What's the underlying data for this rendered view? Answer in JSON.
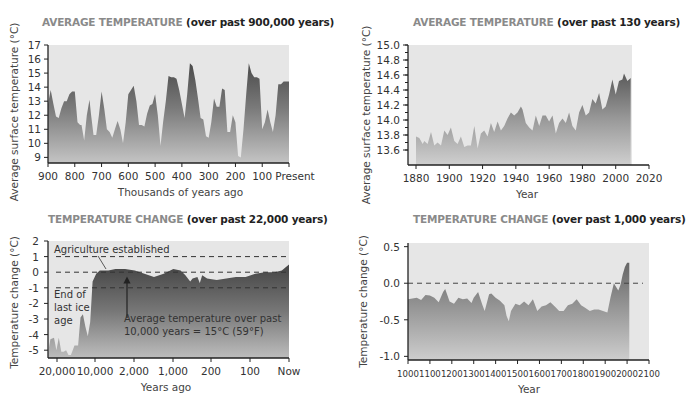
{
  "chart_data": [
    {
      "id": "c1",
      "type": "area",
      "title_main": "AVERAGE TEMPERATURE",
      "title_sub": "(over past 900,000 years)",
      "xlabel": "Thousands of years ago",
      "ylabel": "Average surface temperature (°C)",
      "ylim": [
        9,
        17
      ],
      "yticks": [
        9,
        10,
        11,
        12,
        13,
        14,
        15,
        16,
        17
      ],
      "xticks": [
        "900",
        "800",
        "700",
        "600",
        "500",
        "400",
        "300",
        "200",
        "100",
        "Present"
      ],
      "x": [
        900,
        890,
        880,
        870,
        860,
        850,
        840,
        830,
        820,
        810,
        800,
        790,
        780,
        775,
        765,
        755,
        745,
        740,
        730,
        720,
        710,
        700,
        690,
        680,
        670,
        660,
        650,
        640,
        630,
        620,
        610,
        600,
        590,
        580,
        570,
        560,
        550,
        540,
        530,
        520,
        510,
        500,
        490,
        480,
        470,
        460,
        450,
        440,
        430,
        420,
        410,
        400,
        390,
        380,
        370,
        360,
        350,
        340,
        330,
        320,
        310,
        300,
        290,
        280,
        270,
        260,
        250,
        240,
        230,
        220,
        210,
        200,
        190,
        180,
        170,
        160,
        150,
        140,
        130,
        120,
        110,
        100,
        90,
        80,
        70,
        60,
        50,
        40,
        30,
        20,
        10,
        0
      ],
      "values": [
        12.8,
        13.8,
        12.8,
        11.9,
        11.8,
        12.5,
        13.0,
        13.0,
        13.5,
        13.7,
        13.7,
        11.5,
        11.3,
        11.3,
        10.2,
        12.0,
        13.1,
        12.2,
        10.6,
        10.6,
        12.0,
        13.7,
        12.5,
        11.0,
        10.8,
        10.4,
        11.0,
        11.6,
        11.0,
        10.0,
        11.5,
        13.5,
        13.8,
        14.1,
        13.0,
        11.3,
        11.3,
        11.2,
        12.1,
        12.7,
        12.8,
        13.5,
        12.0,
        9.8,
        11.5,
        13.0,
        14.8,
        14.7,
        14.7,
        14.6,
        13.8,
        12.8,
        11.8,
        13.5,
        15.7,
        15.5,
        14.5,
        13.2,
        11.8,
        11.7,
        10.5,
        10.4,
        11.5,
        13.2,
        12.6,
        12.6,
        13.9,
        13.8,
        10.8,
        10.8,
        12.0,
        11.5,
        9.1,
        9.0,
        11.0,
        13.5,
        15.7,
        15.0,
        14.7,
        14.7,
        14.6,
        11.0,
        11.5,
        12.4,
        11.5,
        10.8,
        12.0,
        14.2,
        14.2,
        14.4,
        14.4,
        14.4
      ]
    },
    {
      "id": "c2",
      "type": "area",
      "title_main": "AVERAGE TEMPERATURE",
      "title_sub": "(over past 130 years)",
      "xlabel": "Year",
      "ylabel": "Average surface temperature (°C)",
      "ylim": [
        13.6,
        15.0
      ],
      "yticks": [
        "15.0",
        "14.8",
        "14.6",
        "14.4",
        "14.2",
        "14.0",
        "13.8",
        "13.6"
      ],
      "xticks": [
        "1880",
        "1900",
        "1920",
        "1940",
        "1960",
        "1980",
        "2000",
        "2020"
      ],
      "x": [
        1880,
        1882,
        1884,
        1885,
        1887,
        1889,
        1891,
        1893,
        1895,
        1897,
        1899,
        1901,
        1903,
        1905,
        1907,
        1909,
        1911,
        1913,
        1915,
        1917,
        1919,
        1921,
        1923,
        1925,
        1927,
        1929,
        1931,
        1933,
        1935,
        1937,
        1939,
        1941,
        1943,
        1944,
        1946,
        1948,
        1950,
        1952,
        1954,
        1956,
        1958,
        1960,
        1962,
        1964,
        1966,
        1968,
        1970,
        1972,
        1974,
        1976,
        1978,
        1980,
        1982,
        1984,
        1986,
        1988,
        1990,
        1992,
        1994,
        1996,
        1998,
        2000,
        2002,
        2004,
        2005,
        2007,
        2009
      ],
      "values": [
        13.78,
        13.76,
        13.68,
        13.72,
        13.68,
        13.84,
        13.66,
        13.7,
        13.66,
        13.86,
        13.8,
        13.9,
        13.72,
        13.68,
        13.78,
        13.64,
        13.66,
        13.66,
        13.92,
        13.62,
        13.82,
        13.86,
        13.78,
        13.96,
        13.84,
        13.98,
        13.86,
        13.92,
        14.02,
        14.1,
        14.06,
        14.1,
        14.18,
        14.14,
        13.96,
        13.9,
        13.86,
        14.06,
        13.92,
        14.06,
        14.06,
        13.98,
        14.06,
        13.82,
        13.96,
        14.02,
        13.96,
        14.1,
        13.92,
        13.86,
        14.1,
        14.2,
        14.06,
        14.1,
        14.28,
        14.22,
        14.36,
        14.14,
        14.18,
        14.34,
        14.54,
        14.34,
        14.52,
        14.54,
        14.62,
        14.52,
        14.56
      ]
    },
    {
      "id": "c3",
      "type": "area",
      "title_main": "TEMPERATURE CHANGE",
      "title_sub": "(over past 22,000 years)",
      "xlabel": "Years ago",
      "ylabel": "Temperature change (°C)",
      "ylim": [
        -5.5,
        2
      ],
      "yticks": [
        2,
        1,
        0,
        -1,
        -2,
        -3,
        -4,
        -5
      ],
      "xticks": [
        "20,000",
        "10,000",
        "2,000",
        "1,000",
        "200",
        "100",
        "Now"
      ],
      "reference_lines": [
        1,
        0,
        -1
      ],
      "annotations": {
        "agriculture": "Agriculture established",
        "ice_age_1": "End of",
        "ice_age_2": "last ice",
        "ice_age_3": "age",
        "avg_1": "Average temperature over past",
        "avg_2": "10,000 years = 15°C (59°F)"
      },
      "x_pos": [
        0.0,
        0.01,
        0.025,
        0.035,
        0.045,
        0.055,
        0.065,
        0.075,
        0.085,
        0.095,
        0.11,
        0.125,
        0.135,
        0.145,
        0.155,
        0.165,
        0.175,
        0.185,
        0.2,
        0.215,
        0.225,
        0.235,
        0.25,
        0.28,
        0.32,
        0.36,
        0.4,
        0.44,
        0.48,
        0.52,
        0.55,
        0.57,
        0.59,
        0.6,
        0.62,
        0.63,
        0.64,
        0.66,
        0.7,
        0.74,
        0.78,
        0.82,
        0.86,
        0.9,
        0.94,
        0.97,
        1.0
      ],
      "values": [
        -5.2,
        -4.3,
        -4.2,
        -5.0,
        -4.2,
        -5.1,
        -5.1,
        -5.0,
        -5.3,
        -5.3,
        -4.7,
        -4.7,
        -2.9,
        -2.7,
        -3.5,
        -4.1,
        -3.2,
        -0.6,
        -0.1,
        0.1,
        0.1,
        0.1,
        0.1,
        0.2,
        0.2,
        0.1,
        -0.1,
        -0.3,
        -0.1,
        0.2,
        0.1,
        -0.2,
        -0.6,
        -0.4,
        -0.3,
        -0.7,
        -0.2,
        -0.4,
        -0.5,
        -0.4,
        -0.3,
        -0.3,
        -0.1,
        0.0,
        0.0,
        0.1,
        0.5
      ]
    },
    {
      "id": "c4",
      "type": "area",
      "title_main": "TEMPERATURE CHANGE",
      "title_sub": "(over past 1,000 years)",
      "xlabel": "Year",
      "ylabel": "Temperature change (°C)",
      "ylim": [
        -1.0,
        0.5
      ],
      "yticks": [
        "0.5",
        "0.0",
        "-0.5",
        "-1.0"
      ],
      "xticks": [
        "1000",
        "1100",
        "1200",
        "1300",
        "1400",
        "1500",
        "1600",
        "1700",
        "1800",
        "1900",
        "2000",
        "2100"
      ],
      "reference_lines": [
        0.0
      ],
      "x": [
        1000,
        1020,
        1040,
        1060,
        1080,
        1100,
        1120,
        1140,
        1160,
        1170,
        1190,
        1210,
        1230,
        1250,
        1270,
        1290,
        1300,
        1320,
        1340,
        1350,
        1370,
        1380,
        1400,
        1420,
        1440,
        1450,
        1460,
        1470,
        1490,
        1510,
        1530,
        1550,
        1570,
        1590,
        1610,
        1630,
        1650,
        1670,
        1690,
        1710,
        1730,
        1750,
        1770,
        1790,
        1810,
        1830,
        1850,
        1870,
        1890,
        1910,
        1925,
        1940,
        1950,
        1960,
        1970,
        1980,
        1990,
        2000,
        2010
      ],
      "values": [
        -0.22,
        -0.21,
        -0.2,
        -0.23,
        -0.16,
        -0.17,
        -0.2,
        -0.26,
        -0.12,
        -0.08,
        -0.25,
        -0.28,
        -0.2,
        -0.22,
        -0.21,
        -0.27,
        -0.2,
        -0.12,
        -0.3,
        -0.38,
        -0.15,
        -0.14,
        -0.2,
        -0.24,
        -0.3,
        -0.45,
        -0.52,
        -0.38,
        -0.28,
        -0.3,
        -0.25,
        -0.3,
        -0.22,
        -0.38,
        -0.32,
        -0.3,
        -0.26,
        -0.32,
        -0.38,
        -0.38,
        -0.3,
        -0.28,
        -0.22,
        -0.3,
        -0.34,
        -0.38,
        -0.36,
        -0.36,
        -0.38,
        -0.4,
        -0.18,
        0.0,
        -0.05,
        -0.1,
        -0.02,
        0.12,
        0.22,
        0.28,
        0.28
      ]
    }
  ]
}
